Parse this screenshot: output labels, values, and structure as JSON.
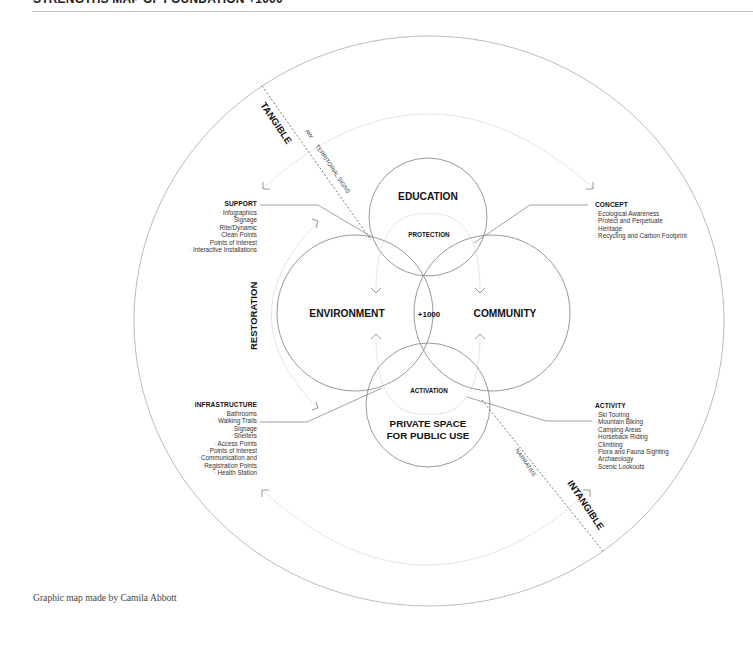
{
  "header": {
    "title": "STRENGTHS MAP OF FOUNDATION +1000"
  },
  "diagram": {
    "center_label": "+1000",
    "circles": {
      "education": "EDUCATION",
      "environment": "ENVIRONMENT",
      "community": "COMMUNITY",
      "private_space_line1": "PRIVATE SPACE",
      "private_space_line2": "FOR PUBLIC USE"
    },
    "flows": {
      "protection": "PROTECTION",
      "activation": "ACTIVATION",
      "restoration": "RESTORATION"
    },
    "axis": {
      "tangible": "TANGIBLE",
      "intangible": "INTANGIBLE",
      "aw": "AW",
      "territorial_signs": "TERRITORIAL SIGNS",
      "narrative": "NARRATIVE"
    },
    "groups": {
      "support": {
        "title": "SUPPORT",
        "items": [
          "Infographics",
          "Signage",
          "Rite/Dynamic",
          "Clean Points",
          "Points of Interest",
          "Interactive Installations"
        ]
      },
      "concept": {
        "title": "CONCEPT",
        "items": [
          "Ecological Awareness",
          "Protect and Perpetuate",
          "Heritage",
          "Recycling and Carbon Footprint"
        ]
      },
      "infrastructure": {
        "title": "INFRASTRUCTURE",
        "items": [
          "Bathrooms",
          "Walking Trails",
          "Signage",
          "Shelters",
          "Access Points",
          "Points of Interest",
          "Communication and",
          "Registration Points",
          "Health Station"
        ]
      },
      "activity": {
        "title": "ACTIVITY",
        "items": [
          "Ski Touring",
          "Mountain Biking",
          "Camping Areas",
          "Horseback Riding",
          "Climbing",
          "Flora and Fauna Sighting",
          "Archaeology",
          "Scenic Lookouts"
        ]
      }
    },
    "colors": {
      "stroke": "#8c8c8c",
      "arc": "#c8c8c8",
      "text": "#111111"
    }
  },
  "caption": "Graphic map made by Camila Abbott"
}
